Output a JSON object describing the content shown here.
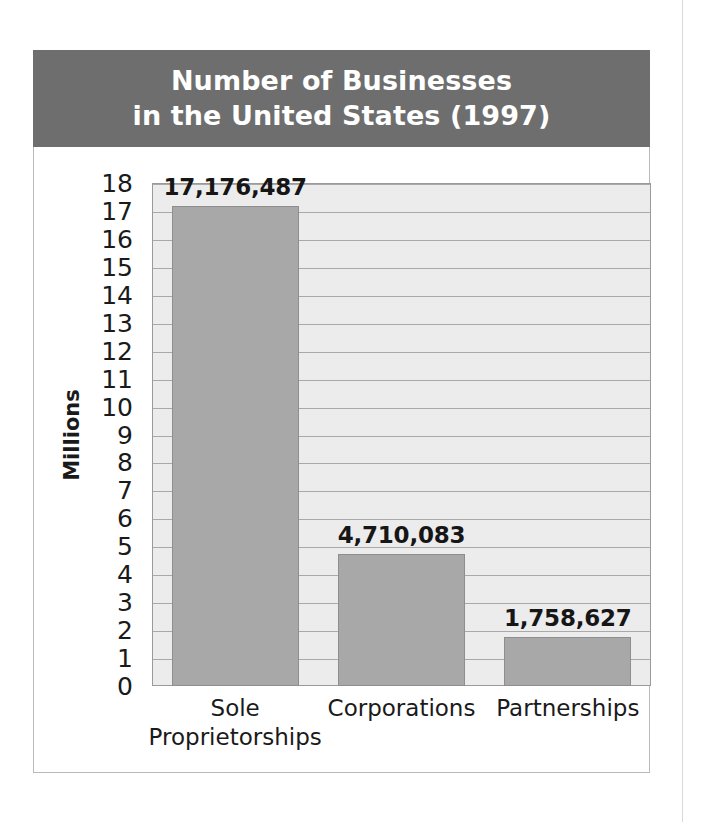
{
  "chart_data": {
    "type": "bar",
    "title": "Number of Businesses\nin the United States (1997)",
    "title_line1": "Number of Businesses",
    "title_line2": "in the United States (1997)",
    "xlabel": "",
    "ylabel": "Millions",
    "categories": [
      "Sole\nProprietorships",
      "Corporations",
      "Partnerships"
    ],
    "category_labels": [
      "Sole\nProprietorships",
      "Corporations",
      "Partnerships"
    ],
    "values": [
      17.176487,
      4.710083,
      1.758627
    ],
    "value_labels": [
      "17,176,487",
      "4,710,083",
      "1,758,627"
    ],
    "raw_values": [
      17176487,
      4710083,
      1758627
    ],
    "ylim": [
      0,
      18
    ],
    "y_ticks": [
      18,
      17,
      16,
      15,
      14,
      13,
      12,
      11,
      10,
      9,
      8,
      7,
      6,
      5,
      4,
      3,
      2,
      1,
      0
    ],
    "y_tick_labels": [
      "18",
      "17",
      "16",
      "15",
      "14",
      "13",
      "12",
      "11",
      "10",
      "9",
      "8",
      "7",
      "6",
      "5",
      "4",
      "3",
      "2",
      "1",
      "0"
    ],
    "grid": true,
    "legend": null,
    "units": "Millions"
  },
  "colors": {
    "title_band": "#6e6e6e",
    "title_text": "#ffffff",
    "bar_fill": "#a8a8a8",
    "bar_border": "#8e8e8e",
    "plot_background": "#ececed",
    "plot_border": "#9a9a9a",
    "gridline": "#a9a9a9",
    "figure_border": "#b9b9b9",
    "text": "#1a1a1a",
    "page_background": "#ffffff"
  }
}
